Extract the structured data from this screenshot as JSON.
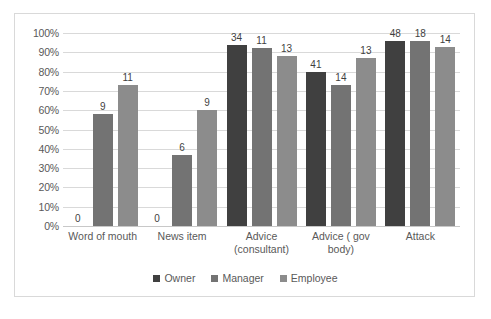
{
  "chart_data": {
    "type": "bar",
    "title": "",
    "subtitle": "",
    "xlabel": "",
    "ylabel": "",
    "ylim": [
      0,
      100
    ],
    "yticks": [
      "0%",
      "10%",
      "20%",
      "30%",
      "40%",
      "50%",
      "60%",
      "70%",
      "80%",
      "90%",
      "100%"
    ],
    "ytick_values": [
      0,
      10,
      20,
      30,
      40,
      50,
      60,
      70,
      80,
      90,
      100
    ],
    "grid": true,
    "legend_position": "bottom",
    "value_unit": "percent",
    "data_labels_are_counts": true,
    "categories": [
      "Word of mouth",
      "News item",
      "Advice (consultant)",
      "Advice ( gov body)",
      "Attack"
    ],
    "series": [
      {
        "name": "Owner",
        "color": "#404040",
        "values": [
          0,
          0,
          94,
          80,
          96
        ],
        "labels": [
          "0",
          "0",
          "34",
          "41",
          "48"
        ]
      },
      {
        "name": "Manager",
        "color": "#737373",
        "values": [
          58,
          37,
          92,
          73,
          96
        ],
        "labels": [
          "9",
          "6",
          "11",
          "14",
          "18"
        ]
      },
      {
        "name": "Employee",
        "color": "#8c8c8c",
        "values": [
          73,
          60,
          88,
          87,
          93
        ],
        "labels": [
          "11",
          "9",
          "13",
          "13",
          "14"
        ]
      }
    ]
  },
  "legend": {
    "items": [
      {
        "label": "Owner",
        "color": "#404040"
      },
      {
        "label": "Manager",
        "color": "#737373"
      },
      {
        "label": "Employee",
        "color": "#8c8c8c"
      }
    ]
  },
  "axis": {
    "y_labels": [
      "100%",
      "90%",
      "80%",
      "70%",
      "60%",
      "50%",
      "40%",
      "30%",
      "20%",
      "10%",
      "0%"
    ],
    "x_labels": [
      "Word of mouth",
      "News item",
      "Advice (consultant)",
      "Advice ( gov body)",
      "Attack"
    ]
  },
  "colors": {
    "gridline": "#d9d9d9",
    "border": "#d9d9d9",
    "text": "#595959",
    "label_text": "#3f3f3f",
    "background": "#ffffff"
  }
}
